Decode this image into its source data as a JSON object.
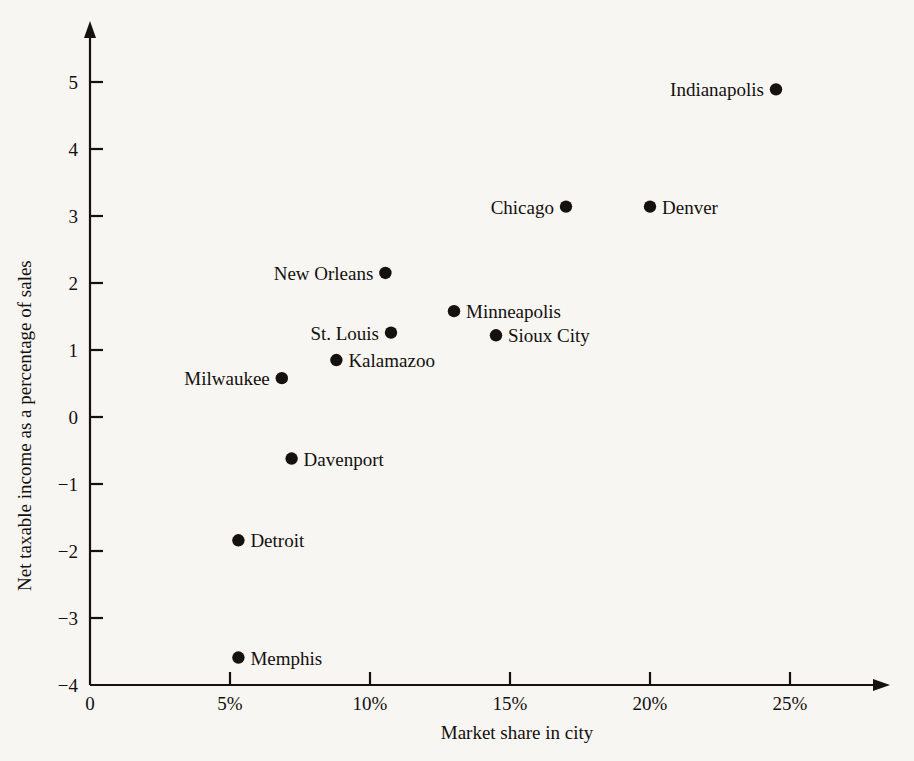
{
  "chart_data": {
    "type": "scatter",
    "title": "",
    "xlabel": "Market share in city",
    "ylabel": "Net taxable income as a percentage of sales",
    "xlim": [
      0,
      27
    ],
    "ylim": [
      -4,
      5.4
    ],
    "grid": false,
    "legend": "none",
    "x_ticks": [
      {
        "value": 0,
        "label": "0"
      },
      {
        "value": 5,
        "label": "5%"
      },
      {
        "value": 10,
        "label": "10%"
      },
      {
        "value": 15,
        "label": "15%"
      },
      {
        "value": 20,
        "label": "20%"
      },
      {
        "value": 25,
        "label": "25%"
      }
    ],
    "y_ticks": [
      {
        "value": 5,
        "label": "5"
      },
      {
        "value": 4,
        "label": "4"
      },
      {
        "value": 3,
        "label": "3"
      },
      {
        "value": 2,
        "label": "2"
      },
      {
        "value": 1,
        "label": "1"
      },
      {
        "value": 0,
        "label": "0"
      },
      {
        "value": -1,
        "label": "−1"
      },
      {
        "value": -2,
        "label": "−2"
      },
      {
        "value": -3,
        "label": "−3"
      },
      {
        "value": -4,
        "label": "−4"
      }
    ],
    "points": [
      {
        "name": "Indianapolis",
        "x": 24.5,
        "y": 4.89,
        "label_side": "left"
      },
      {
        "name": "Chicago",
        "x": 17.0,
        "y": 3.14,
        "label_side": "left"
      },
      {
        "name": "Denver",
        "x": 20.0,
        "y": 3.14,
        "label_side": "right"
      },
      {
        "name": "New Orleans",
        "x": 10.55,
        "y": 2.15,
        "label_side": "left"
      },
      {
        "name": "Minneapolis",
        "x": 13.0,
        "y": 1.58,
        "label_side": "right"
      },
      {
        "name": "St. Louis",
        "x": 10.75,
        "y": 1.26,
        "label_side": "left"
      },
      {
        "name": "Sioux City",
        "x": 14.5,
        "y": 1.22,
        "label_side": "right"
      },
      {
        "name": "Kalamazoo",
        "x": 8.8,
        "y": 0.85,
        "label_side": "right"
      },
      {
        "name": "Milwaukee",
        "x": 6.85,
        "y": 0.58,
        "label_side": "left"
      },
      {
        "name": "Davenport",
        "x": 7.2,
        "y": -0.62,
        "label_side": "right"
      },
      {
        "name": "Detroit",
        "x": 5.3,
        "y": -1.84,
        "label_side": "right"
      },
      {
        "name": "Memphis",
        "x": 5.3,
        "y": -3.59,
        "label_side": "right"
      }
    ],
    "colors": {
      "marker": "#15110e",
      "axis": "#15110e",
      "text": "#14100d",
      "background": "#f7f6f2"
    }
  }
}
